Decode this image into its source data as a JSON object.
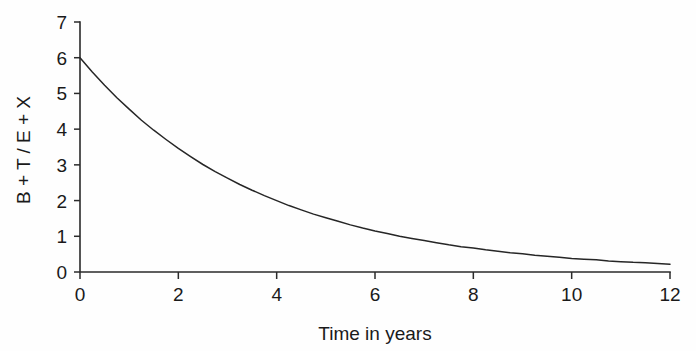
{
  "chart_data": {
    "type": "line",
    "title": "",
    "subtitle": "",
    "xlabel": "Time in years",
    "ylabel": "B + T / E + X",
    "xlim": [
      0,
      12
    ],
    "ylim": [
      0,
      7
    ],
    "xticks": [
      0,
      2,
      4,
      6,
      8,
      10,
      12
    ],
    "xtick_labels": [
      "0",
      "2",
      "4",
      "6",
      "8",
      "10",
      "12"
    ],
    "yticks": [
      0,
      1,
      2,
      3,
      4,
      5,
      6,
      7
    ],
    "ytick_labels": [
      "0",
      "1",
      "2",
      "3",
      "4",
      "5",
      "6",
      "7"
    ],
    "grid": false,
    "legend": null,
    "line_color": "#262626",
    "axis_color": "#2b2b2b",
    "background_color": "#fefefe",
    "series": [
      {
        "name": "B + T / E + X",
        "x": [
          0,
          0.25,
          0.5,
          0.75,
          1,
          1.25,
          1.5,
          1.75,
          2,
          2.25,
          2.5,
          2.75,
          3,
          3.25,
          3.5,
          3.75,
          4,
          4.25,
          4.5,
          4.75,
          5,
          5.25,
          5.5,
          5.75,
          6,
          6.25,
          6.5,
          6.75,
          7,
          7.25,
          7.5,
          7.75,
          8,
          8.25,
          8.5,
          8.75,
          9,
          9.25,
          9.5,
          9.75,
          10,
          10.25,
          10.5,
          10.75,
          11,
          11.25,
          11.5,
          11.75,
          12
        ],
        "y": [
          6.0,
          5.6,
          5.23,
          4.88,
          4.56,
          4.25,
          3.97,
          3.71,
          3.46,
          3.23,
          3.01,
          2.81,
          2.63,
          2.45,
          2.29,
          2.14,
          2.0,
          1.86,
          1.74,
          1.62,
          1.52,
          1.42,
          1.32,
          1.23,
          1.15,
          1.08,
          1.0,
          0.94,
          0.88,
          0.82,
          0.76,
          0.71,
          0.67,
          0.62,
          0.58,
          0.54,
          0.51,
          0.47,
          0.44,
          0.41,
          0.38,
          0.36,
          0.34,
          0.31,
          0.29,
          0.27,
          0.26,
          0.24,
          0.22
        ]
      }
    ]
  },
  "axes": {
    "y_axis_title": "B + T / E + X",
    "x_axis_title": "Time in years"
  }
}
